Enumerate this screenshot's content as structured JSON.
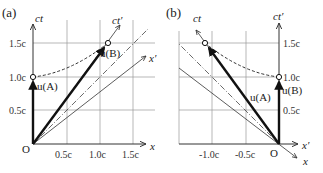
{
  "panels": [
    {
      "id": "a",
      "label": "(a)",
      "axes": {
        "y": "ct",
        "x": "x",
        "y_prime": "ct′",
        "x_prime": "x′",
        "origin": "O"
      },
      "x_ticks": [
        "0.5c",
        "1.0c",
        "1.5c"
      ],
      "y_ticks": [
        "0.5c",
        "1.0c",
        "1.5c"
      ],
      "vectors": [
        {
          "name": "u(A)",
          "from": [
            0,
            0
          ],
          "to": [
            0,
            1.0
          ]
        },
        {
          "name": "u(B)",
          "from": [
            0,
            0
          ],
          "to": [
            1.1,
            1.5
          ]
        }
      ],
      "curve": "dashed hyperbola from (0,1.0c) to (1.1c,1.5c)"
    },
    {
      "id": "b",
      "label": "(b)",
      "axes": {
        "y": "ct",
        "x": "x",
        "y_prime": "ct′",
        "x_prime": "x′",
        "origin": "O"
      },
      "x_ticks": [
        "-1.0c",
        "-0.5c"
      ],
      "y_ticks": [
        "0.5c",
        "1.0c",
        "1.5c"
      ],
      "vectors": [
        {
          "name": "u(A)",
          "from": [
            0,
            0
          ],
          "to": [
            -1.1,
            1.5
          ]
        },
        {
          "name": "u(B)",
          "from": [
            0,
            0
          ],
          "to": [
            0,
            1.0
          ]
        }
      ],
      "curve": "dashed hyperbola from (0,1.0c) to (-1.1c,1.5c)"
    }
  ],
  "text": {
    "a_label": "(a)",
    "b_label": "(b)",
    "ct": "ct",
    "ctp": "ct′",
    "x": "x",
    "xp": "x′",
    "O": "O",
    "uA": "u(A)",
    "uB": "u(B)",
    "t05": "0.5c",
    "t10": "1.0c",
    "t15": "1.5c",
    "tm10": "-1.0c",
    "tm05": "-0.5c"
  }
}
